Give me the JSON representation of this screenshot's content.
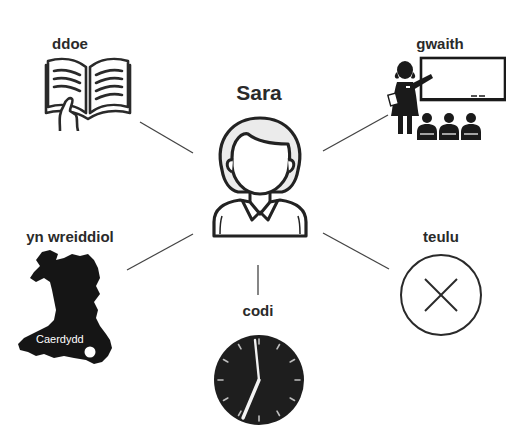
{
  "diagram": {
    "title": "",
    "center": {
      "label": "Sara",
      "icon": "woman-person-icon"
    },
    "nodes": [
      {
        "id": "ddoe",
        "label": "ddoe",
        "icon": "open-book-icon",
        "position": "top-left"
      },
      {
        "id": "gwaith",
        "label": "gwaith",
        "icon": "teacher-classroom-icon",
        "position": "top-right"
      },
      {
        "id": "yn-wreiddiol",
        "label": "yn wreiddiol",
        "icon": "wales-map-icon",
        "position": "bottom-left",
        "map_label": "Caerdydd"
      },
      {
        "id": "codi",
        "label": "codi",
        "icon": "clock-icon",
        "position": "bottom",
        "clock_time": "7:00"
      },
      {
        "id": "teulu",
        "label": "teulu",
        "icon": "circle-x-icon",
        "position": "bottom-right"
      }
    ],
    "colors": {
      "ink": "#2a2a2a",
      "line": "#444444",
      "clock_face": "#1e1e1e",
      "hair_fill": "#ebebeb"
    }
  }
}
